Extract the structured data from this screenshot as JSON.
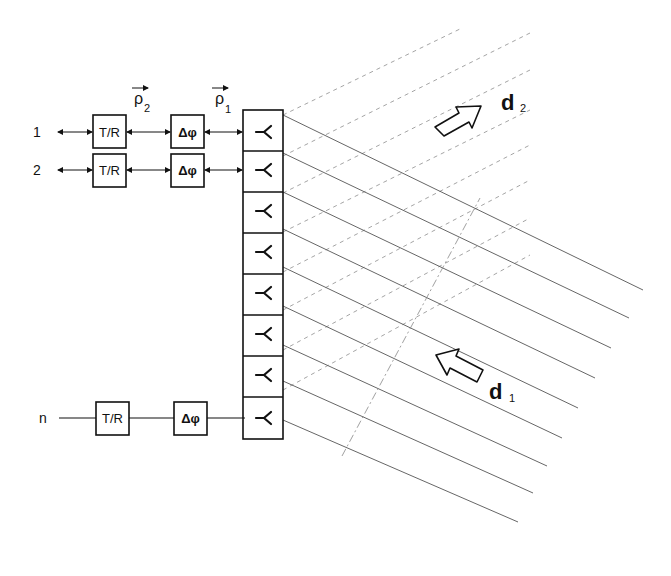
{
  "diagram": {
    "channels": [
      {
        "label": "1",
        "tr": "T/R",
        "phase": "Δφ",
        "y": 132
      },
      {
        "label": "2",
        "tr": "T/R",
        "phase": "Δφ",
        "y": 170
      },
      {
        "label": "n",
        "tr": "T/R",
        "phase": "Δφ",
        "y": 418
      }
    ],
    "vectors": {
      "rho2": "ρ",
      "rho2_sub": "2",
      "rho1": "ρ",
      "rho1_sub": "1"
    },
    "antenna_elements": 8,
    "antenna_symbol": "⋎",
    "directions": {
      "d1": {
        "letter": "d",
        "sub": "1"
      },
      "d2": {
        "letter": "d",
        "sub": "2"
      }
    },
    "colors": {
      "ink": "#111111",
      "dashed": "#9a9a9a",
      "line": "#555555"
    }
  }
}
